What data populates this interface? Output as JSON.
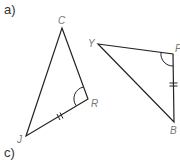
{
  "parts": {
    "a": "a)",
    "c": "c)"
  },
  "triangle1": {
    "vertices": {
      "C": "C",
      "R": "R",
      "J": "J"
    },
    "marks": {
      "angle_at": "R",
      "equal_side": "JR",
      "ticks": 2
    }
  },
  "triangle2": {
    "vertices": {
      "Y": "Y",
      "P": "P",
      "B": "B"
    },
    "marks": {
      "angle_at": "P",
      "equal_side": "PB",
      "ticks": 2
    }
  },
  "colors": {
    "line": "#222222",
    "label": "#777777"
  }
}
